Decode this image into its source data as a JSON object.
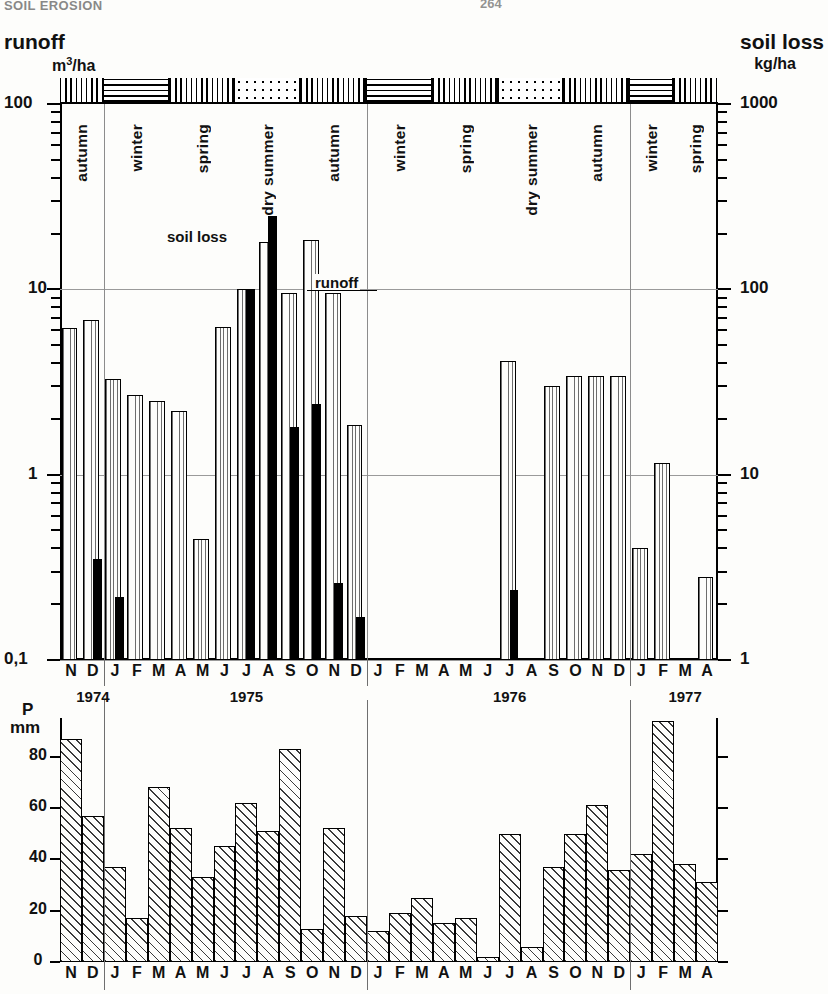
{
  "header": {
    "running_head": "SOIL EROSION",
    "page_number": "264"
  },
  "top_chart": {
    "left_title": "runoff",
    "right_title": "soil loss",
    "left_units": "m3/ha",
    "left_units_sup": "3",
    "left_units_base": "m",
    "left_units_tail": "/ha",
    "right_units": "kg/ha",
    "y_left_labels": [
      "100",
      "10",
      "1",
      "0,1"
    ],
    "y_right_labels": [
      "1000",
      "100",
      "10",
      "1"
    ],
    "annotation_soil_loss": "soil loss",
    "annotation_runoff": "runoff",
    "season_labels": [
      "autumn",
      "winter",
      "spring",
      "dry summer",
      "autumn",
      "winter",
      "spring",
      "dry summer",
      "autumn",
      "winter",
      "spring"
    ],
    "season_patterns": [
      "vertical",
      "horizontal",
      "vertical",
      "dots",
      "vertical",
      "horizontal",
      "vertical",
      "dots",
      "vertical",
      "horizontal",
      "vertical"
    ]
  },
  "bottom_chart": {
    "y_title_line1": "P",
    "y_title_line2": "mm",
    "y_labels": [
      "0",
      "20",
      "40",
      "60",
      "80"
    ]
  },
  "axis": {
    "months": [
      "N",
      "D",
      "J",
      "F",
      "M",
      "A",
      "M",
      "J",
      "J",
      "A",
      "S",
      "O",
      "N",
      "D",
      "J",
      "F",
      "M",
      "A",
      "M",
      "J",
      "J",
      "A",
      "S",
      "O",
      "N",
      "D",
      "J",
      "F",
      "M",
      "A"
    ],
    "years": [
      "1974",
      "1975",
      "1976",
      "1977"
    ]
  },
  "chart_data": [
    {
      "type": "bar",
      "title": "runoff and soil loss",
      "xlabel": "",
      "ylabel": "runoff (m3/ha) / soil loss (kg/ha)",
      "yscale": "log",
      "ylim": [
        0.1,
        100
      ],
      "ylim_right": [
        1,
        1000
      ],
      "grid": true,
      "legend_position": "inline-annotation",
      "categories": [
        "N1974",
        "D1974",
        "J1975",
        "F1975",
        "M1975",
        "A1975",
        "M1975b",
        "J1975",
        "J1975b",
        "A1975",
        "S1975",
        "O1975",
        "N1975",
        "D1975",
        "J1976",
        "F1976",
        "M1976",
        "A1976",
        "M1976b",
        "J1976",
        "J1976b",
        "A1976",
        "S1976",
        "O1976",
        "N1976",
        "D1976",
        "J1977",
        "F1977",
        "M1977",
        "A1977"
      ],
      "series": [
        {
          "name": "runoff",
          "unit": "m3/ha",
          "values": [
            6.2,
            6.8,
            3.3,
            2.7,
            2.5,
            2.2,
            0.45,
            6.3,
            10.0,
            18.0,
            9.5,
            18.5,
            9.5,
            1.85,
            null,
            null,
            null,
            null,
            null,
            null,
            4.1,
            null,
            3.0,
            3.4,
            3.4,
            3.4,
            0.4,
            1.15,
            null,
            0.28
          ]
        },
        {
          "name": "soil loss",
          "unit": "kg/ha",
          "values": [
            null,
            3.5,
            2.2,
            null,
            null,
            null,
            null,
            null,
            100,
            250,
            18,
            24,
            2.6,
            1.7,
            null,
            null,
            null,
            null,
            null,
            null,
            2.4,
            null,
            null,
            null,
            null,
            null,
            null,
            null,
            null,
            null
          ]
        }
      ]
    },
    {
      "type": "bar",
      "title": "precipitation",
      "xlabel": "",
      "ylabel": "P mm",
      "ylim": [
        0,
        95
      ],
      "yticks": [
        0,
        20,
        40,
        60,
        80
      ],
      "grid": false,
      "categories": [
        "N",
        "D",
        "J",
        "F",
        "M",
        "A",
        "M",
        "J",
        "J",
        "A",
        "S",
        "O",
        "N",
        "D",
        "J",
        "F",
        "M",
        "A",
        "M",
        "J",
        "J",
        "A",
        "S",
        "O",
        "N",
        "D",
        "J",
        "F",
        "M",
        "A"
      ],
      "values": [
        87,
        57,
        37,
        17,
        68,
        52,
        33,
        45,
        62,
        51,
        83,
        13,
        52,
        18,
        12,
        19,
        25,
        15,
        17,
        2,
        50,
        6,
        37,
        50,
        61,
        36,
        42,
        94,
        38,
        31
      ]
    }
  ]
}
